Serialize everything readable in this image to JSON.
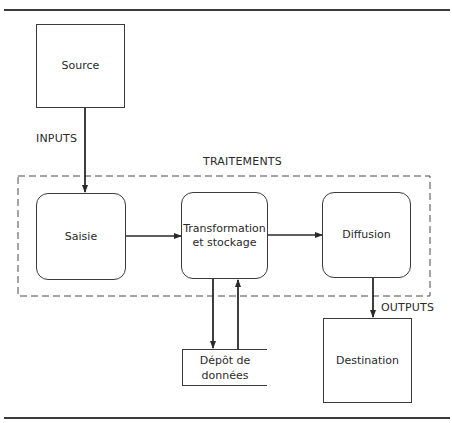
{
  "diagram": {
    "nodes": {
      "source": {
        "label": "Source"
      },
      "saisie": {
        "label": "Saisie"
      },
      "transformation": {
        "label_line1": "Transformation",
        "label_line2": "et stockage"
      },
      "diffusion": {
        "label": "Diffusion"
      },
      "depot": {
        "label_line1": "Dépôt de",
        "label_line2": "données"
      },
      "destination": {
        "label": "Destination"
      }
    },
    "group": {
      "label": "TRAITEMENTS"
    },
    "edges": [
      {
        "from": "source",
        "to": "saisie",
        "label": "INPUTS"
      },
      {
        "from": "saisie",
        "to": "transformation",
        "label": ""
      },
      {
        "from": "transformation",
        "to": "diffusion",
        "label": ""
      },
      {
        "from": "transformation",
        "to": "depot",
        "label": ""
      },
      {
        "from": "depot",
        "to": "transformation",
        "label": ""
      },
      {
        "from": "diffusion",
        "to": "destination",
        "label": "OUTPUTS"
      }
    ],
    "edge_labels": {
      "inputs": "INPUTS",
      "outputs": "OUTPUTS"
    },
    "colors": {
      "stroke": "#3a3a3a",
      "background": "#ffffff",
      "text": "#2a2a2a"
    }
  }
}
